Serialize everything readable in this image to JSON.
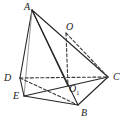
{
  "figure": {
    "kind": "geometry-diagram",
    "canvas": {
      "width": 124,
      "height": 128
    },
    "colors": {
      "background": "#ffffff",
      "stroke_solid": "#262626",
      "stroke_light": "#8c8c8c",
      "stroke_dashed": "#3a3a3a",
      "label": "#1a1a1a"
    },
    "vertices": [
      {
        "id": "A",
        "label": "A",
        "sub": "",
        "x": 32,
        "y": 10,
        "label_x": 24,
        "label_y": 2
      },
      {
        "id": "O",
        "label": "O",
        "sub": "",
        "x": 66,
        "y": 33,
        "label_x": 66,
        "label_y": 22
      },
      {
        "id": "C",
        "label": "C",
        "sub": "",
        "x": 108,
        "y": 77,
        "label_x": 113,
        "label_y": 72
      },
      {
        "id": "D",
        "label": "D",
        "sub": "",
        "x": 20,
        "y": 78,
        "label_x": 4,
        "label_y": 73
      },
      {
        "id": "O1",
        "label": "O",
        "sub": "1",
        "x": 68,
        "y": 86,
        "label_x": 69,
        "label_y": 84
      },
      {
        "id": "E",
        "label": "E",
        "sub": "",
        "x": 24,
        "y": 96,
        "label_x": 13,
        "label_y": 91
      },
      {
        "id": "B",
        "label": "B",
        "sub": "",
        "x": 78,
        "y": 105,
        "label_x": 81,
        "label_y": 108
      }
    ],
    "edges": [
      {
        "from": "A",
        "to": "D",
        "style": "solid",
        "weight": "dark"
      },
      {
        "from": "A",
        "to": "E",
        "style": "solid",
        "weight": "light"
      },
      {
        "from": "A",
        "to": "B",
        "style": "solid",
        "weight": "dark"
      },
      {
        "from": "A",
        "to": "C",
        "style": "solid",
        "weight": "dark"
      },
      {
        "from": "A",
        "to": "O1",
        "style": "solid",
        "weight": "dark"
      },
      {
        "from": "D",
        "to": "E",
        "style": "solid",
        "weight": "dark"
      },
      {
        "from": "E",
        "to": "B",
        "style": "solid",
        "weight": "dark"
      },
      {
        "from": "B",
        "to": "C",
        "style": "solid",
        "weight": "dark"
      },
      {
        "from": "E",
        "to": "C",
        "style": "solid",
        "weight": "dark"
      },
      {
        "from": "D",
        "to": "C",
        "style": "dashed",
        "weight": "dark"
      },
      {
        "from": "D",
        "to": "B",
        "style": "dashed",
        "weight": "dark"
      },
      {
        "from": "O",
        "to": "O1",
        "style": "dashed",
        "weight": "dark"
      },
      {
        "from": "O",
        "to": "C",
        "style": "dashed",
        "weight": "dark"
      }
    ]
  }
}
